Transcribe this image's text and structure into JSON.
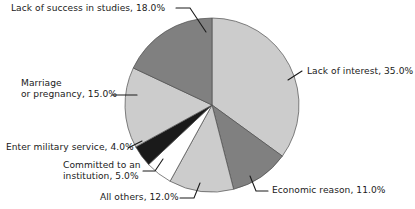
{
  "chart_data": {
    "type": "pie",
    "title": "",
    "subtitle": "",
    "xlabel": "",
    "ylabel": "",
    "legend_position": "none",
    "grid": false,
    "units": "percent",
    "start_angle_deg": 0,
    "direction": "clockwise",
    "categories": [
      "Lack of interest",
      "Economic reason",
      "All others",
      "Committed to an institution",
      "Enter military service",
      "Marriage or pregnancy",
      "Lack of success in studies"
    ],
    "values": [
      35.0,
      11.0,
      12.0,
      5.0,
      4.0,
      15.0,
      18.0
    ],
    "total": 100.0,
    "slice_colors": [
      "#cccccc",
      "#808080",
      "#cccccc",
      "#ffffff",
      "#1a1a1a",
      "#cccccc",
      "#808080"
    ],
    "slices": [
      {
        "label": "Lack of interest",
        "value": 35.0,
        "value_text": "35.0%",
        "color": "#cccccc"
      },
      {
        "label": "Economic reason",
        "value": 11.0,
        "value_text": "11.0%",
        "color": "#808080"
      },
      {
        "label": "All others",
        "value": 12.0,
        "value_text": "12.0%",
        "color": "#cccccc"
      },
      {
        "label": "Committed to an institution",
        "value": 5.0,
        "value_text": "5.0%",
        "color": "#ffffff"
      },
      {
        "label": "Enter military service",
        "value": 4.0,
        "value_text": "4.0%",
        "color": "#1a1a1a"
      },
      {
        "label": "Marriage or pregnancy",
        "value": 15.0,
        "value_text": "15.0%",
        "color": "#cccccc"
      },
      {
        "label": "Lack of success in studies",
        "value": 18.0,
        "value_text": "18.0%",
        "color": "#808080"
      }
    ]
  },
  "labels": {
    "lack_of_success": "Lack of success in studies, 18.0%",
    "lack_of_interest": "Lack of interest, 35.0%",
    "marriage_line1": "Marriage",
    "marriage_line2": "or pregnancy, 15.0%",
    "military": "Enter military service, 4.0%",
    "institution_line1": "Committed to an",
    "institution_line2": "institution, 5.0%",
    "all_others": "All others, 12.0%",
    "economic": "Economic reason, 11.0%"
  },
  "colors": {
    "background": "#ffffff",
    "text": "#1a1a1a",
    "slice_light": "#cccccc",
    "slice_medium": "#808080",
    "slice_white": "#ffffff",
    "slice_dark": "#1a1a1a",
    "slice_outline": "#4d4d4d",
    "leader_line": "#1a1a1a"
  }
}
